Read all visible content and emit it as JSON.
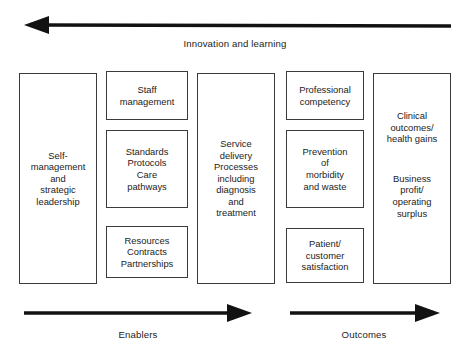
{
  "diagram": {
    "title_top_axis": "Innovation and learning",
    "bottom_axis_left": "Enablers",
    "bottom_axis_right": "Outcomes",
    "colors": {
      "ink": "#1c1c1c",
      "border": "#3b3b3b",
      "arrow": "#121212",
      "background": "#ffffff"
    },
    "arrows": [
      {
        "name": "innovation-and-learning-arrow",
        "direction": "left",
        "label": "Innovation and learning"
      },
      {
        "name": "enablers-arrow",
        "direction": "right",
        "label": "Enablers"
      },
      {
        "name": "outcomes-arrow",
        "direction": "right",
        "label": "Outcomes"
      }
    ],
    "columns": [
      {
        "id": "leadership",
        "boxes": [
          {
            "id": "self-management",
            "text": "Self-\nmanagement\nand\nstrategic\nleadership"
          }
        ]
      },
      {
        "id": "enablers",
        "boxes": [
          {
            "id": "staff-management",
            "text": "Staff\nmanagement"
          },
          {
            "id": "standards-protocols",
            "text": "Standards\nProtocols\nCare\npathways"
          },
          {
            "id": "resources-contracts",
            "text": "Resources\nContracts\nPartnerships"
          }
        ]
      },
      {
        "id": "processes",
        "boxes": [
          {
            "id": "service-delivery",
            "text": "Service\ndelivery\nProcesses\nincluding\ndiagnosis\nand\ntreatment"
          }
        ]
      },
      {
        "id": "outcome-measures",
        "boxes": [
          {
            "id": "professional-competency",
            "text": "Professional\ncompetency"
          },
          {
            "id": "prevention-morbidity",
            "text": "Prevention\nof\nmorbidity\nand waste"
          },
          {
            "id": "patient-satisfaction",
            "text": "Patient/\ncustomer\nsatisfaction"
          }
        ]
      },
      {
        "id": "results",
        "boxes": [
          {
            "id": "clinical-outcomes",
            "text": "Clinical\noutcomes/\nhealth gains"
          },
          {
            "id": "business-profit",
            "text": "Business\nprofit/\noperating\nsurplus"
          }
        ]
      }
    ]
  }
}
